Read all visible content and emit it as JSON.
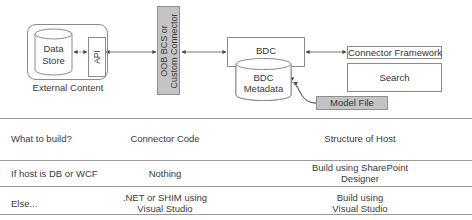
{
  "diagram": {
    "external_content": {
      "label": "External Content",
      "data_store_line1": "Data",
      "data_store_line2": "Store",
      "api_label": "API"
    },
    "connector_bar": {
      "line1": "OOB BCS or",
      "line2": "Custom Connector"
    },
    "bdc": {
      "label": "BDC",
      "metadata_line1": "BDC",
      "metadata_line2": "Metadata"
    },
    "connector_framework_label": "Connector Framework",
    "search_label": "Search",
    "model_file_label": "Model File",
    "colors": {
      "line": "#8a8a8a",
      "gray_fill": "#c4c4c4",
      "text": "#3a3a3a"
    }
  },
  "table": {
    "rows": [
      {
        "question": "What to build?",
        "connector": "Connector Code",
        "host_line1": "Structure of Host",
        "host_line2": ""
      },
      {
        "question": "If host is DB or WCF",
        "connector": "Nothing",
        "host_line1": "Build using SharePoint",
        "host_line2": "Designer"
      },
      {
        "question": "Else...",
        "connector_line1": ".NET or SHIM using",
        "connector_line2": "Visual Studio",
        "host_line1": "Build using",
        "host_line2": "Visual Studio"
      }
    ]
  }
}
